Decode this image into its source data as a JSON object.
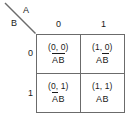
{
  "kmap": {
    "title": "Karnaugh map for two variables A and B",
    "corner": {
      "column_variable": "A",
      "row_variable": "B",
      "diagonal": "diagonal-divider"
    },
    "column_headers": [
      "0",
      "1"
    ],
    "row_headers": [
      "0",
      "1"
    ],
    "colors": {
      "grid_line": "#6b6b6b",
      "text": "#1a1a1a",
      "background": "#ffffff"
    },
    "cells": [
      {
        "id": "cell-a0-b0",
        "coords": "(0, 0)",
        "a_value": "0",
        "b_value": "0",
        "term_a": "A",
        "term_b": "B",
        "a_negated": true,
        "b_negated": true,
        "term_text": "A̅B̅"
      },
      {
        "id": "cell-a1-b0",
        "coords": "(1, 0)",
        "a_value": "1",
        "b_value": "0",
        "term_a": "A",
        "term_b": "B",
        "a_negated": false,
        "b_negated": true,
        "term_text": "AB̅"
      },
      {
        "id": "cell-a0-b1",
        "coords": "(0, 1)",
        "a_value": "0",
        "b_value": "1",
        "term_a": "A",
        "term_b": "B",
        "a_negated": true,
        "b_negated": false,
        "term_text": "A̅B"
      },
      {
        "id": "cell-a1-b1",
        "coords": "(1, 1)",
        "a_value": "1",
        "b_value": "1",
        "term_a": "A",
        "term_b": "B",
        "a_negated": false,
        "b_negated": false,
        "term_text": "AB"
      }
    ]
  }
}
